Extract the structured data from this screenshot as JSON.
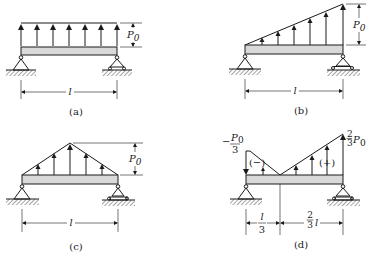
{
  "figures": [
    {
      "id": "a",
      "caption": "(a)",
      "load_type": "uniform",
      "load_label": "P",
      "load_label_sub": "0",
      "span_label": "l",
      "left_support": "pin",
      "right_support": "roller"
    },
    {
      "id": "b",
      "caption": "(b)",
      "load_type": "triangular-increasing",
      "load_label": "P",
      "load_label_sub": "0",
      "span_label": "l",
      "left_support": "pin",
      "right_support": "roller"
    },
    {
      "id": "c",
      "caption": "(c)",
      "load_type": "triangular-symmetric",
      "load_label": "P",
      "load_label_sub": "0",
      "span_label": "l",
      "left_support": "pin",
      "right_support": "roller"
    },
    {
      "id": "d",
      "caption": "(d)",
      "load_type": "linear-sign-change",
      "left_value_sign": "−",
      "left_value_num": "P",
      "left_value_sub": "0",
      "left_value_den": "3",
      "right_value_num": "2",
      "right_value_den": "3",
      "right_value_sym": "P",
      "right_value_sub": "0",
      "negative_region_label": "(−)",
      "positive_region_label": "(+)",
      "left_span_num": "l",
      "left_span_den": "3",
      "right_span_num": "2",
      "right_span_den": "3",
      "right_span_sym": "l",
      "left_support": "pin",
      "right_support": "roller"
    }
  ]
}
